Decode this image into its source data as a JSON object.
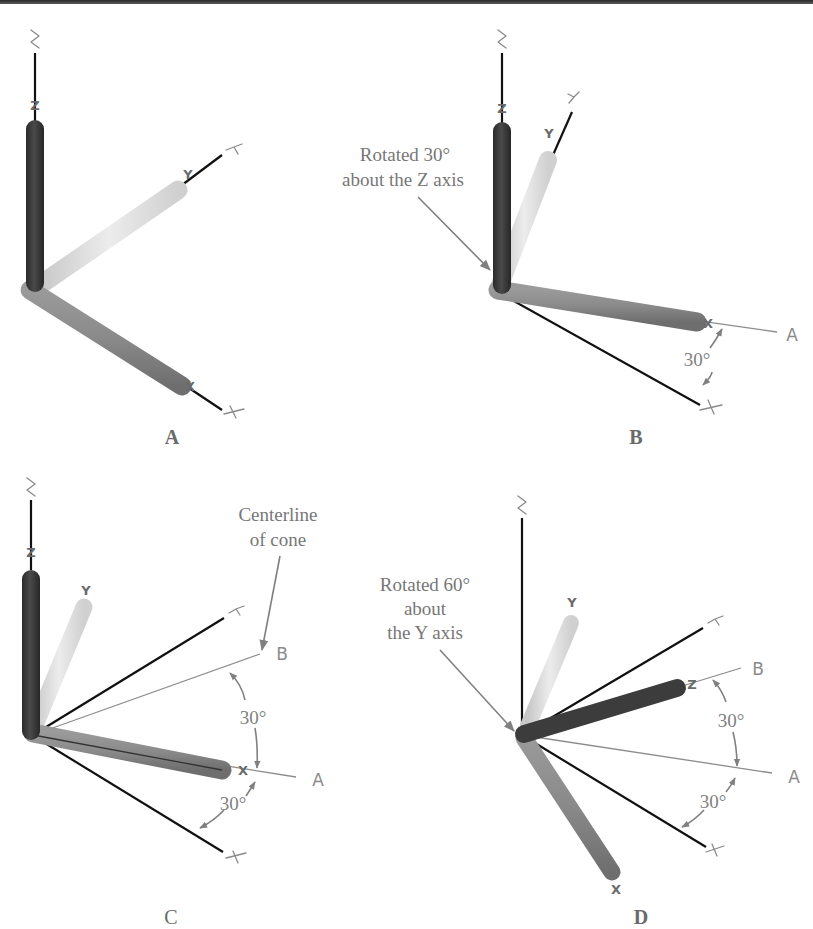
{
  "figure": {
    "panels": [
      {
        "id": "A",
        "label": "A",
        "rods": {
          "z": "Z",
          "y": "Y",
          "x": "X"
        },
        "axis_letters": {
          "z": "Z",
          "y": "Y",
          "x": "X"
        }
      },
      {
        "id": "B",
        "label": "B",
        "callout": [
          "Rotated 30°",
          "about the Z axis"
        ],
        "angle": "30°",
        "ref_lines": {
          "a": "A"
        },
        "rods": {
          "z": "Z",
          "y": "Y",
          "x": "X"
        },
        "axis_letters": {
          "z": "Z",
          "y": "Y",
          "x": "X"
        }
      },
      {
        "id": "C",
        "label": "C",
        "callout": [
          "Centerline",
          "of cone"
        ],
        "angles": [
          "30°",
          "30°"
        ],
        "ref_lines": {
          "a": "A",
          "b": "B"
        },
        "rods": {
          "z": "Z",
          "y": "Y",
          "x": "X"
        },
        "axis_letters": {
          "z": "Z",
          "y": "Y",
          "x": "X"
        }
      },
      {
        "id": "D",
        "label": "D",
        "callout": [
          "Rotated 60°",
          "about",
          "the Y axis"
        ],
        "angles": [
          "30°",
          "30°"
        ],
        "ref_lines": {
          "a": "A",
          "b": "B"
        },
        "rods": {
          "z": "Z",
          "y": "Y",
          "x": "X"
        },
        "axis_letters": {
          "z": "Z",
          "y": "Y",
          "x": "X"
        }
      }
    ],
    "colors": {
      "z_rod": "#3a3a3a",
      "y_rod": "#dcdcdc",
      "x_rod": "#8a8a8a",
      "text": "#777777",
      "axis_line": "#111111"
    }
  }
}
